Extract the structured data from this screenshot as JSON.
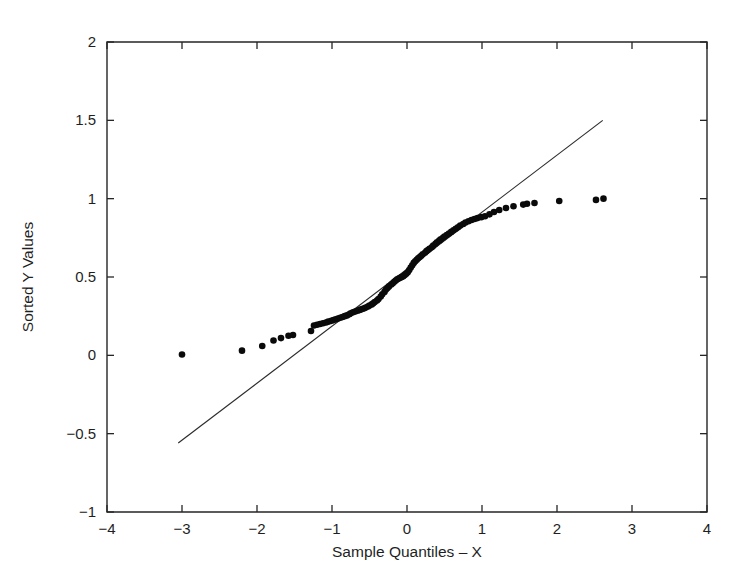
{
  "chart_data": {
    "type": "scatter",
    "title": "",
    "subtitle": "",
    "xlabel": "Sample Quantiles – X",
    "ylabel": "Sorted Y Values",
    "xlim": [
      -4,
      4
    ],
    "ylim": [
      -1,
      2
    ],
    "xticks": [
      -4,
      -3,
      -2,
      -1,
      0,
      1,
      2,
      3,
      4
    ],
    "xtick_labels": [
      "−4",
      "−3",
      "−2",
      "−1",
      "0",
      "1",
      "2",
      "3",
      "4"
    ],
    "yticks": [
      -1,
      -0.5,
      0,
      0.5,
      1,
      1.5,
      2
    ],
    "ytick_labels": [
      "−1",
      "−0.5",
      "0",
      "0.5",
      "1",
      "1.5",
      "2"
    ],
    "grid": false,
    "legend": null,
    "legend_position": "none",
    "marker": "filled-circle",
    "marker_color": "#0a0a0a",
    "marker_size": 4.6,
    "line_color": "#2b2b2b",
    "series": [
      {
        "name": "Sorted Y Values vs Sample Quantiles",
        "type": "scatter",
        "x": [
          -3.0,
          -2.2,
          -1.93,
          -1.78,
          -1.68,
          -1.58,
          -1.52,
          -1.28,
          -1.24,
          -1.2,
          -1.16,
          -1.12,
          -1.08,
          -1.05,
          -1.01,
          -0.98,
          -0.95,
          -0.92,
          -0.89,
          -0.86,
          -0.83,
          -0.8,
          -0.77,
          -0.75,
          -0.72,
          -0.69,
          -0.66,
          -0.63,
          -0.6,
          -0.57,
          -0.55,
          -0.52,
          -0.5,
          -0.47,
          -0.45,
          -0.43,
          -0.4,
          -0.38,
          -0.35,
          -0.33,
          -0.3,
          -0.28,
          -0.26,
          -0.24,
          -0.21,
          -0.19,
          -0.17,
          -0.15,
          -0.13,
          -0.11,
          -0.09,
          -0.07,
          -0.05,
          -0.03,
          -0.01,
          0.01,
          0.03,
          0.05,
          0.07,
          0.09,
          0.11,
          0.13,
          0.15,
          0.17,
          0.19,
          0.21,
          0.24,
          0.26,
          0.28,
          0.3,
          0.33,
          0.35,
          0.38,
          0.4,
          0.43,
          0.45,
          0.48,
          0.5,
          0.53,
          0.56,
          0.59,
          0.62,
          0.65,
          0.68,
          0.71,
          0.75,
          0.78,
          0.82,
          0.86,
          0.9,
          0.94,
          0.99,
          1.04,
          1.1,
          1.16,
          1.23,
          1.32,
          1.42,
          1.55,
          1.6,
          1.7,
          2.03,
          2.52,
          2.62
        ],
        "y": [
          0.005,
          0.03,
          0.06,
          0.095,
          0.11,
          0.125,
          0.13,
          0.155,
          0.19,
          0.195,
          0.2,
          0.205,
          0.21,
          0.215,
          0.22,
          0.225,
          0.23,
          0.235,
          0.24,
          0.245,
          0.25,
          0.255,
          0.262,
          0.268,
          0.275,
          0.28,
          0.285,
          0.29,
          0.295,
          0.3,
          0.305,
          0.312,
          0.318,
          0.325,
          0.332,
          0.34,
          0.35,
          0.36,
          0.375,
          0.39,
          0.405,
          0.42,
          0.43,
          0.44,
          0.452,
          0.46,
          0.47,
          0.478,
          0.485,
          0.49,
          0.495,
          0.5,
          0.505,
          0.512,
          0.52,
          0.53,
          0.545,
          0.56,
          0.575,
          0.59,
          0.6,
          0.61,
          0.62,
          0.628,
          0.635,
          0.645,
          0.655,
          0.665,
          0.672,
          0.68,
          0.69,
          0.7,
          0.712,
          0.722,
          0.732,
          0.74,
          0.75,
          0.758,
          0.768,
          0.778,
          0.788,
          0.798,
          0.808,
          0.818,
          0.828,
          0.838,
          0.848,
          0.856,
          0.864,
          0.87,
          0.876,
          0.882,
          0.888,
          0.9,
          0.915,
          0.928,
          0.94,
          0.952,
          0.962,
          0.968,
          0.972,
          0.985,
          0.992,
          1.0
        ]
      }
    ],
    "reference_line": {
      "name": "reference line",
      "type": "line",
      "x": [
        -3.05,
        2.61
      ],
      "y": [
        -0.56,
        1.5
      ]
    },
    "annotations": []
  },
  "figure": {
    "background_color": "#ffffff",
    "axis_color": "#262626",
    "text_color": "#1f1f1f"
  }
}
